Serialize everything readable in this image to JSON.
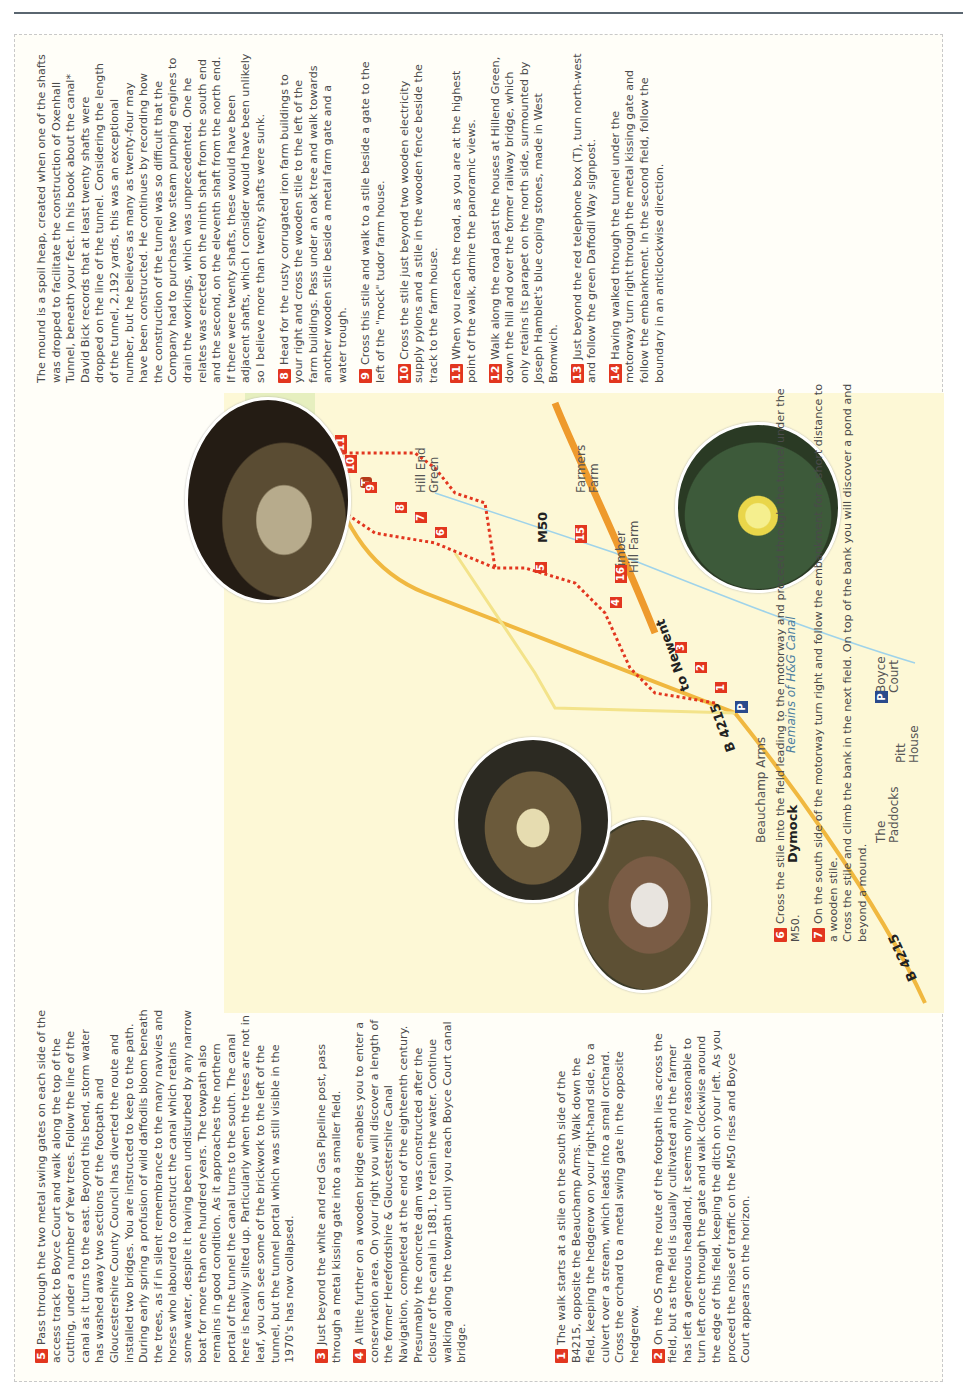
{
  "page": {
    "rule_color": "#5a6670",
    "accent": "#e2361f",
    "parking_color": "#2a4a8c"
  },
  "steps": [
    {
      "n": "1",
      "text": "The walk starts at a stile on the south side of the B4215, opposite the Beauchamp Arms. Walk down the field, keeping the hedgerow on your right-hand side, to a culvert over a stream, which leads into a small orchard.",
      "extra": "Cross the orchard to a metal swing gate in the opposite hedgerow."
    },
    {
      "n": "2",
      "text": "On the OS map the route of the footpath lies across the field, but as the field is usually cultivated and the farmer has left a generous headland, it seems only reasonable to turn left once through the gate and walk clockwise around the edge of this field, keeping the ditch on your left. As you proceed the noise of traffic on the M50 rises and Boyce Court appears on the horizon."
    },
    {
      "n": "3",
      "text": "Just beyond the white and red Gas Pipeline post, pass through a metal kissing gate into a smaller field."
    },
    {
      "n": "4",
      "text": "A little further on a wooden bridge enables you to enter a conservation area. On your right you will discover a length of the former Herefordshire & Gloucestershire Canal Navigation, completed at the end of the eighteenth century. Presumably the concrete dam was constructed after the closure of the canal in 1881, to retain the water. Continue walking along the towpath until you reach Boyce Court canal bridge."
    },
    {
      "n": "5",
      "text": "Pass through the two metal swing gates on each side of the access track to Boyce Court and walk along the top of the cutting, under a number of Yew trees. Follow the line of the canal as it turns to the east. Beyond this bend, storm water has washed away two sections of the footpath and Gloucestershire County Council has diverted the route and installed two bridges. You are instructed to keep to the path. During early spring a profusion of wild daffodils bloom beneath the trees, as if in silent remembrance to the many navvies and horses who laboured to construct the canal which retains some water, despite it having been undisturbed by any narrow boat for more than one hundred years. The towpath also remains in good condition. As it approaches the northern portal of the tunnel the canal turns to the south. The canal here is heavily silted up. Particularly when the trees are not in leaf, you can see some of the brickwork to the left of the tunnel, but the tunnel portal which was still visible in the 1970's has now collapsed."
    },
    {
      "n": "6",
      "text": "Cross the stile into the field leading to the motorway and proceed through the tunnel under the M50."
    },
    {
      "n": "7",
      "text": "On the south side of the motorway turn right and follow the embankment for a short distance to a wooden stile.",
      "extra": "Cross the stile and climb the bank in the next field. On top of the bank you will discover a pond and beyond a mound."
    },
    {
      "n": "8",
      "text": "Head for the rusty corrugated iron farm buildings to your right and cross the wooden stile to the left of the farm buildings. Pass under an oak tree and walk towards another wooden stile beside a metal farm gate and a water trough."
    },
    {
      "n": "9",
      "text": "Cross this stile and walk to a stile beside a gate to the left of the \"mock\" tudor farm house."
    },
    {
      "n": "10",
      "text": "Cross the stile just beyond two wooden electricity supply pylons and a stile in the wooden fence beside the track to the farm house."
    },
    {
      "n": "11",
      "text": "When you reach the road, as you are at the highest point of the walk, admire the panoramic views."
    },
    {
      "n": "12",
      "text": "Walk along the road past the houses at Hillend Green, down the hill and over the former railway bridge, which only retains its parapet on the north side, surmounted by Joseph Hamblet's blue coping stones, made in West Bromwich."
    },
    {
      "n": "13",
      "text": "Just beyond the red telephone box (T), turn north-west and follow the green Daffodil Way signpost."
    },
    {
      "n": "14",
      "text": "Having walked through the tunnel under the motorway turn right through the metal kissing gate and follow the embankment. In the second field, follow the boundary in an anticlockwise direction."
    }
  ],
  "mound_paragraph": "The mound is a spoil heap, created when one of the shafts was dropped to facilitate the construction of Oxenhall Tunnel, beneath your feet. In his book about the canal* David Bick records that at least twenty shafts were dropped on the line of the tunnel. Considering the length of the tunnel, 2,192 yards, this was an exceptional number, but he believes as many as twenty-four may have been constructed. He continues by recording how the construction of the tunnel was so difficult that the Company had to purchase two steam pumping engines to drain the workings, which was unprecedented. One he relates was erected on the ninth shaft from the south end and the second, on the eleventh shaft from the north end. If there were twenty shafts, these would have been adjacent shafts, which I consider would have been unlikely so I believe more than twenty shafts were sunk.",
  "map": {
    "labels": {
      "dymock": "Dymock",
      "beauchamp": "Beauchamp Arms",
      "b4215_a": "B 4215",
      "b4215_b": "B 4215",
      "to_newent": "to Newent",
      "canal": "Remains of H&G Canal",
      "paddocks": "The\nPaddocks",
      "pitt": "Pitt\nHouse",
      "boyce": "Boyce\nCourt",
      "timber": "Timber\nHill Farm",
      "farmers": "Farmers\nFarm",
      "m50": "M50",
      "hillend": "Hill End\nGreen",
      "parking": "P",
      "phone": "T"
    },
    "markers": [
      "1",
      "2",
      "3",
      "4",
      "5",
      "6",
      "7",
      "8",
      "9",
      "10",
      "11",
      "12",
      "13",
      "14",
      "15",
      "16"
    ],
    "photos": [
      "tunnel-portal-photo",
      "tree-roots-photo",
      "daffodils-photo",
      "tunnel-interior-photo"
    ]
  }
}
